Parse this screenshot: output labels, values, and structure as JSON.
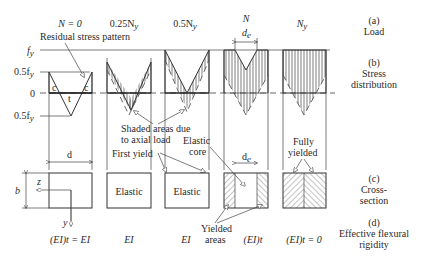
{
  "row_labels": {
    "load": {
      "letter": "(a)",
      "name": "Load"
    },
    "stress": {
      "letter": "(b)",
      "name1": "Stress",
      "name2": "distribution"
    },
    "cross": {
      "letter": "(c)",
      "name1": "Cross-",
      "name2": "section"
    },
    "rigidity": {
      "letter": "(d)",
      "name1": "Effective flexural",
      "name2": "rigidity"
    }
  },
  "axis_labels": {
    "fy": "f",
    "fy_sub": "y",
    "half_fy": "0.5f",
    "zero": "0",
    "neg_half_fy": "0.5f"
  },
  "columns": [
    {
      "load": "N = 0",
      "rigidity": "(EI)t = EI"
    },
    {
      "load": "0.25N",
      "load_sub": "y",
      "rigidity": "EI"
    },
    {
      "load": "0.5N",
      "load_sub": "y",
      "rigidity": "EI"
    },
    {
      "load": "N",
      "rigidity": "(EI)t"
    },
    {
      "load": "N",
      "load_sub": "y",
      "rigidity": "(EI)t = 0"
    }
  ],
  "annotations": {
    "residual": "Residual stress pattern",
    "shaded1": "Shaded areas due",
    "shaded2": "to axial load",
    "first_yield": "First yield",
    "elastic_core1": "Elastic",
    "elastic_core2": "core",
    "fully1": "Fully",
    "fully2": "yielded",
    "yielded1": "Yielded",
    "yielded2": "areas",
    "elastic": "Elastic",
    "c": "c",
    "t": "t",
    "d": "d",
    "de": "d",
    "de_sub": "e",
    "b": "b",
    "z": "z",
    "y": "y"
  }
}
